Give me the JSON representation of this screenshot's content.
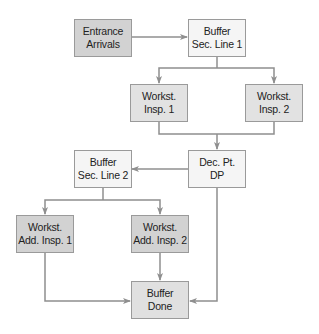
{
  "colors": {
    "dark_fill": "#d2d2d2",
    "mid_fill": "#e2e2e2",
    "light_fill": "#f5f5f5",
    "line": "#8f8f8f",
    "border": "#9a9a9a",
    "text": "#222222"
  },
  "nodes": [
    {
      "id": "entrance",
      "line1": "Entrance",
      "line2": "Arrivals",
      "fill": "dark_fill"
    },
    {
      "id": "buffer1",
      "line1": "Buffer",
      "line2": "Sec. Line 1",
      "fill": "light_fill"
    },
    {
      "id": "insp1",
      "line1": "Workst.",
      "line2": "Insp. 1",
      "fill": "mid_fill"
    },
    {
      "id": "insp2",
      "line1": "Workst.",
      "line2": "Insp. 2",
      "fill": "mid_fill"
    },
    {
      "id": "decision",
      "line1": "Dec. Pt.",
      "line2": "DP",
      "fill": "light_fill"
    },
    {
      "id": "buffer2",
      "line1": "Buffer",
      "line2": "Sec. Line 2",
      "fill": "light_fill"
    },
    {
      "id": "addinsp1",
      "line1": "Workst.",
      "line2": "Add. Insp. 1",
      "fill": "dark_fill"
    },
    {
      "id": "addinsp2",
      "line1": "Workst.",
      "line2": "Add. Insp. 2",
      "fill": "dark_fill"
    },
    {
      "id": "done",
      "line1": "Buffer",
      "line2": "Done",
      "fill": "mid_fill"
    }
  ],
  "edges": [
    {
      "from": "entrance",
      "to": "buffer1"
    },
    {
      "from": "buffer1",
      "to": "insp1"
    },
    {
      "from": "buffer1",
      "to": "insp2"
    },
    {
      "from": "insp1",
      "to": "decision"
    },
    {
      "from": "insp2",
      "to": "decision"
    },
    {
      "from": "decision",
      "to": "buffer2"
    },
    {
      "from": "decision",
      "to": "done"
    },
    {
      "from": "buffer2",
      "to": "addinsp1"
    },
    {
      "from": "buffer2",
      "to": "addinsp2"
    },
    {
      "from": "addinsp1",
      "to": "done"
    },
    {
      "from": "addinsp2",
      "to": "done"
    }
  ]
}
